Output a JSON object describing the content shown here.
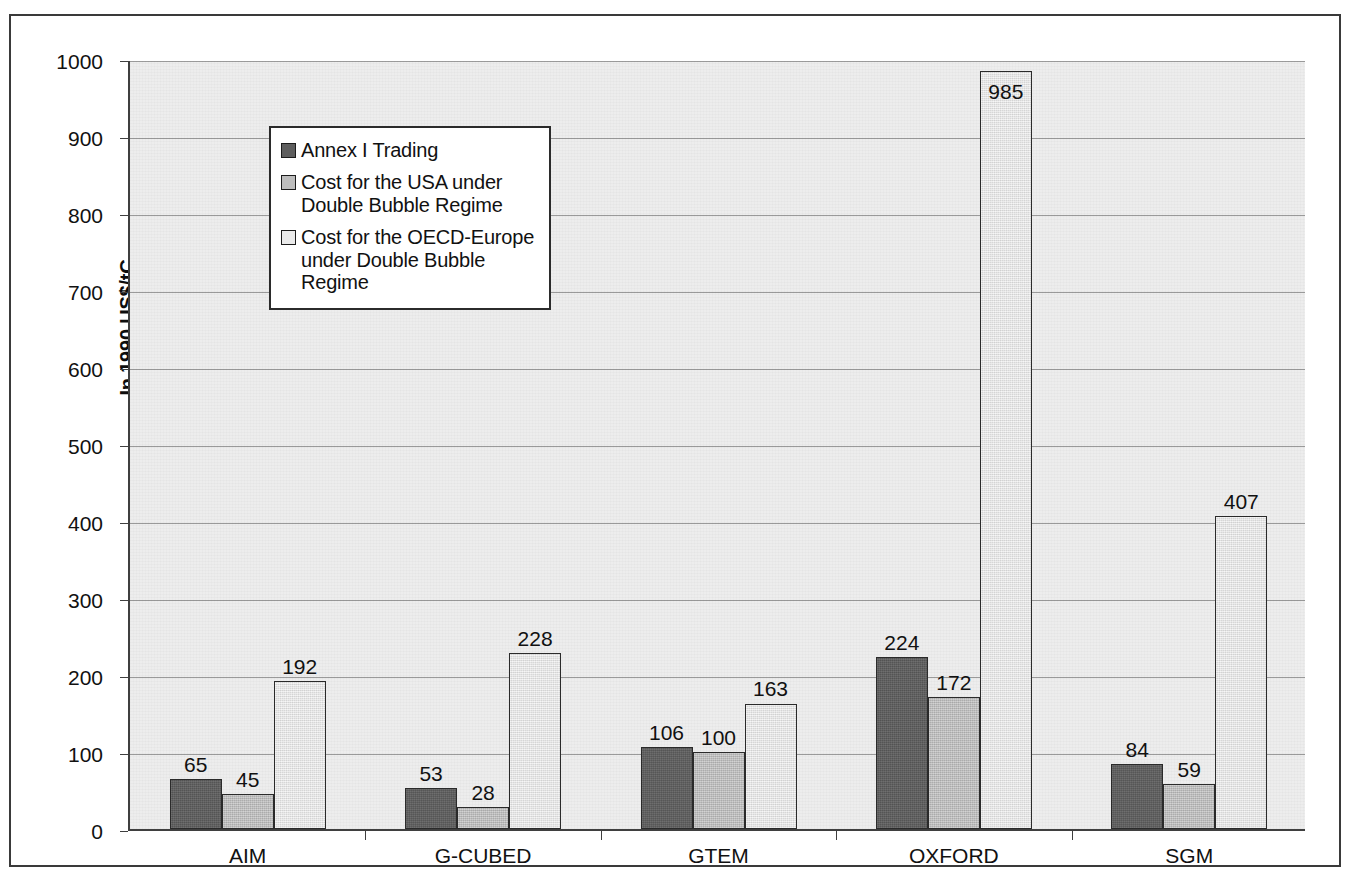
{
  "chart_data": {
    "type": "bar",
    "title": "",
    "subtitle": "",
    "xlabel": "",
    "ylabel": "In 1990 US$/tC",
    "ylim": [
      0,
      1000
    ],
    "ytick_step": 100,
    "grid": true,
    "legend_position": "top-left inside plot",
    "categories": [
      "AIM",
      "G-CUBED",
      "GTEM",
      "OXFORD",
      "SGM"
    ],
    "y_ticks": [
      "0",
      "100",
      "200",
      "300",
      "400",
      "500",
      "600",
      "700",
      "800",
      "900",
      "1000"
    ],
    "series": [
      {
        "name": "Annex I Trading",
        "color": "#5e5e5e",
        "values": [
          65,
          53,
          106,
          224,
          84
        ]
      },
      {
        "name": "Cost for the USA under Double Bubble Regime",
        "color": "#bdbdbd",
        "values": [
          45,
          28,
          100,
          172,
          59
        ]
      },
      {
        "name": "Cost for the OECD-Europe under Double Bubble Regime",
        "color": "#e9e9e9",
        "values": [
          192,
          228,
          163,
          985,
          407
        ]
      }
    ]
  },
  "legend": {
    "items": [
      {
        "label": "Annex I Trading",
        "swatch": "s0"
      },
      {
        "label": "Cost for the USA under\nDouble Bubble Regime",
        "swatch": "s1"
      },
      {
        "label": "Cost for the OECD-Europe\nunder Double Bubble Regime",
        "swatch": "s2"
      }
    ]
  },
  "axis": {
    "y_title": "In 1990 US$/tC"
  }
}
